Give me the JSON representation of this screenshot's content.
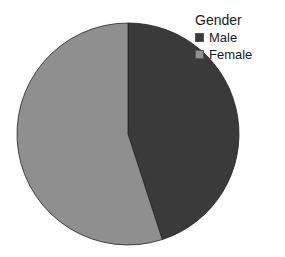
{
  "chart_data": {
    "type": "pie",
    "title": "",
    "legend_title": "Gender",
    "legend_position": "top-right",
    "categories": [
      "Male",
      "Female"
    ],
    "values": [
      45,
      55
    ],
    "colors": [
      "#3a3a3a",
      "#8f8f8f"
    ],
    "start_angle_deg": 0,
    "direction": "clockwise"
  },
  "legend": {
    "title": "Gender",
    "items": [
      {
        "label": "Male",
        "color": "#3a3a3a"
      },
      {
        "label": "Female",
        "color": "#8f8f8f"
      }
    ]
  }
}
